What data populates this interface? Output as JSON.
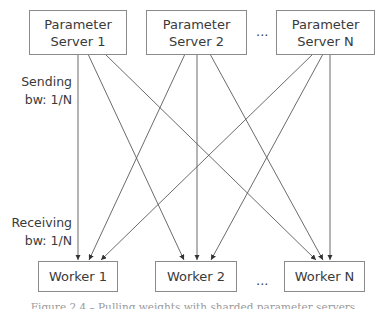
{
  "diagram": {
    "servers": [
      {
        "line1": "Parameter",
        "line2": "Server 1"
      },
      {
        "line1": "Parameter",
        "line2": "Server 2"
      },
      {
        "line1": "Parameter",
        "line2": "Server N"
      }
    ],
    "server_ellipsis": "...",
    "workers": [
      {
        "label": "Worker 1"
      },
      {
        "label": "Worker 2"
      },
      {
        "label": "Worker N"
      }
    ],
    "worker_ellipsis": "...",
    "sending_label": {
      "line1": "Sending",
      "line2": "bw: 1/N"
    },
    "receiving_label": {
      "line1": "Receiving",
      "line2": "bw: 1/N"
    },
    "edges": [
      {
        "from": "Parameter Server 1",
        "to": "Worker 1"
      },
      {
        "from": "Parameter Server 1",
        "to": "Worker 2"
      },
      {
        "from": "Parameter Server 1",
        "to": "Worker N"
      },
      {
        "from": "Parameter Server 2",
        "to": "Worker 1"
      },
      {
        "from": "Parameter Server 2",
        "to": "Worker 2"
      },
      {
        "from": "Parameter Server 2",
        "to": "Worker N"
      },
      {
        "from": "Parameter Server N",
        "to": "Worker 1"
      },
      {
        "from": "Parameter Server N",
        "to": "Worker 2"
      },
      {
        "from": "Parameter Server N",
        "to": "Worker N"
      }
    ],
    "caption": "Figure 2.4 – Pulling weights with sharded parameter servers",
    "colors": {
      "line": "#5a5a5a",
      "box_border": "#8a8a8a",
      "text": "#3a3a3a"
    }
  }
}
